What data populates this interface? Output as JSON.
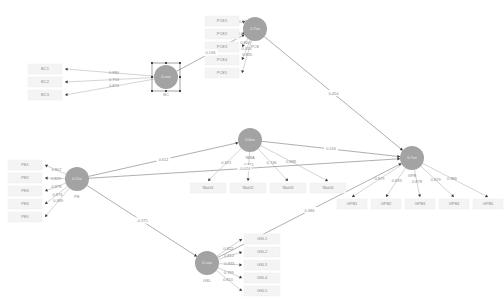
{
  "latents": [
    {
      "id": "BC",
      "name": "BC",
      "value": "0.xxx"
    },
    {
      "id": "PCE",
      "name": "PCE",
      "value": "0.7xx"
    },
    {
      "id": "PE",
      "name": "PE",
      "value": "0.7xx"
    },
    {
      "id": "MBA",
      "name": "WBA",
      "value": "0.6xx"
    },
    {
      "id": "GSL",
      "name": "GSL",
      "value": "0.xxx"
    },
    {
      "id": "GPB",
      "name": "GPB",
      "value": "0.7xx"
    }
  ],
  "indicators": {
    "BC": [
      "BC1",
      "BC2",
      "BC3"
    ],
    "PCE": [
      "PCE1",
      "PCE2",
      "PCE3",
      "PCE4",
      "PCE5"
    ],
    "PE": [
      "PE1",
      "PE2",
      "PE3",
      "PE4",
      "PE5"
    ],
    "MBA": [
      "Wahl1",
      "Wahl2",
      "Wahl3",
      "Wahl4"
    ],
    "GSL": [
      "GSL1",
      "GSL2",
      "GSL3",
      "GSL4",
      "GSL5"
    ],
    "GPB": [
      "GPB1",
      "GPB2",
      "GPB3",
      "GPB4",
      "GPB5"
    ]
  },
  "loadings": {
    "BC": [
      "0.880",
      "0.753",
      "0.870"
    ],
    "PCE": [
      "0.879",
      "0.864",
      "0.800",
      "0.816",
      "0.835"
    ],
    "PE": [
      "0.807",
      "0.829",
      "0.878",
      "0.876",
      "0.869"
    ],
    "MBA": [
      "0.821",
      "0.811",
      "0.746",
      "0.888"
    ],
    "GSL": [
      "0.822",
      "0.812",
      "0.833",
      "0.799",
      "0.810"
    ],
    "GPB": [
      "0.879",
      "0.833",
      "0.878",
      "0.829",
      "0.886"
    ]
  },
  "paths": [
    {
      "from": "BC",
      "to": "PCE",
      "coef": "0.136"
    },
    {
      "from": "PCE",
      "to": "GPB",
      "coef": "0.454"
    },
    {
      "from": "PE",
      "to": "MBA",
      "coef": "0.611"
    },
    {
      "from": "PE",
      "to": "GPB",
      "coef": "-0.024"
    },
    {
      "from": "MBA",
      "to": "GPB",
      "coef": "0.116"
    },
    {
      "from": "PE",
      "to": "GSL",
      "coef": "-0.375"
    },
    {
      "from": "GSL",
      "to": "GPB",
      "coef": "0.386"
    }
  ]
}
